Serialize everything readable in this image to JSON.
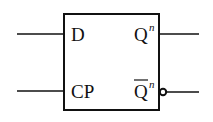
{
  "diagram": {
    "type": "d-flip-flop",
    "inputs": [
      {
        "label": "D"
      },
      {
        "label": "CP"
      }
    ],
    "outputs": [
      {
        "label": "Q",
        "superscript": "n",
        "inverted": false
      },
      {
        "label": "Q",
        "superscript": "n",
        "inverted": true,
        "overline": true
      }
    ],
    "colors": {
      "stroke": "#111111",
      "background": "#ffffff"
    }
  }
}
